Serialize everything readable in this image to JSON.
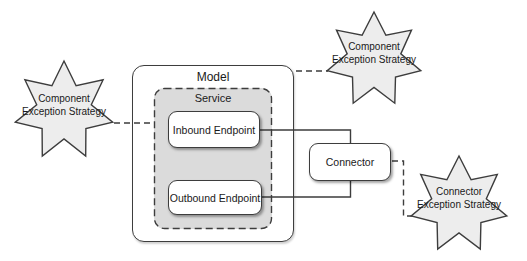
{
  "diagram": {
    "model": {
      "label": "Model"
    },
    "service": {
      "label": "Service"
    },
    "inbound_endpoint": {
      "label": "Inbound Endpoint"
    },
    "outbound_endpoint": {
      "label": "Outbound Endpoint"
    },
    "connector": {
      "label": "Connector"
    },
    "exception_strategies": {
      "left": {
        "label": "Component Exception Strategy"
      },
      "top_right": {
        "label": "Component Exception Strategy"
      },
      "bottom_right": {
        "label": "Connector Exception Strategy"
      }
    },
    "colors": {
      "border": "#3d3d3d",
      "box_fill": "#ffffff",
      "service_fill": "#dbdbdb",
      "star_fill": "#ededed",
      "background": "#ffffff"
    }
  }
}
